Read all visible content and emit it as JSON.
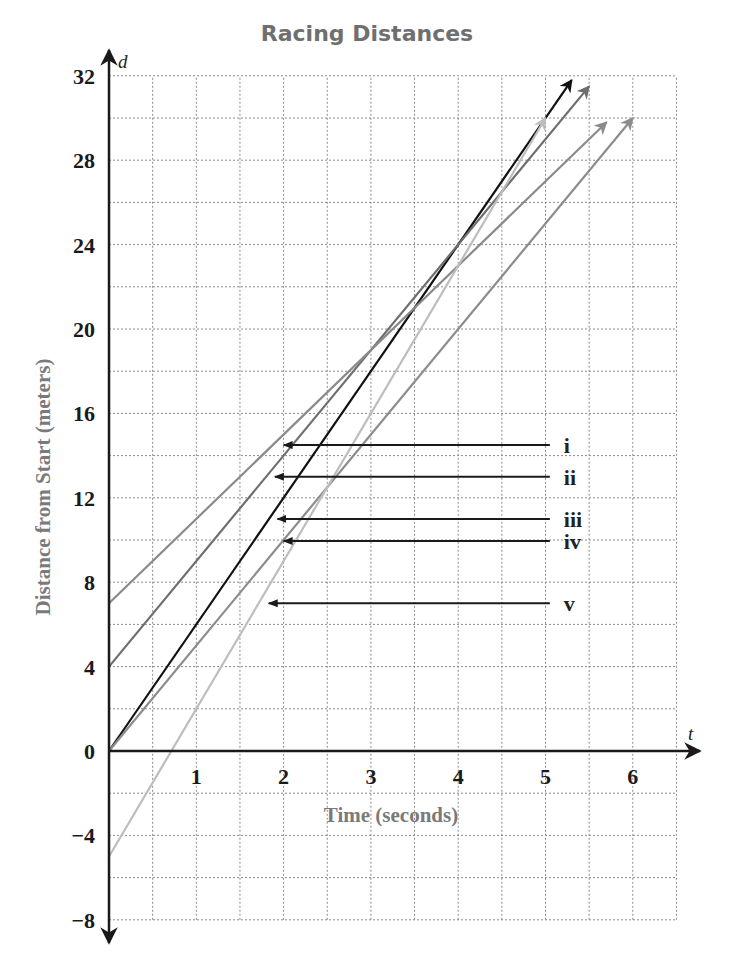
{
  "chart_data": {
    "type": "line",
    "title": "Racing Distances",
    "xlabel": "Time (seconds)",
    "ylabel": "Distance from Start (meters)",
    "x_var": "t",
    "y_var": "d",
    "xlim": [
      0,
      6.5
    ],
    "ylim": [
      -8,
      32
    ],
    "x_ticks": [
      1,
      2,
      3,
      4,
      5,
      6
    ],
    "y_ticks": [
      -8,
      -4,
      0,
      4,
      8,
      12,
      16,
      20,
      24,
      28,
      32
    ],
    "grid": {
      "on": true,
      "style": "dotted",
      "x_step": 0.5,
      "y_step": 2
    },
    "legend": "none (callout labels i–v)",
    "series": [
      {
        "name": "line-black",
        "intercept": 0,
        "slope": 6,
        "t_end": 5.3,
        "color": "#111111"
      },
      {
        "name": "line-gray-a",
        "intercept": 4,
        "slope": 5,
        "t_end": 5.5,
        "color": "#6e6e6e"
      },
      {
        "name": "line-gray-b",
        "intercept": 7,
        "slope": 4,
        "t_end": 5.7,
        "color": "#8a8a8a"
      },
      {
        "name": "line-gray-c",
        "intercept": 0,
        "slope": 5,
        "t_end": 6.0,
        "color": "#8c8c8c"
      },
      {
        "name": "line-light",
        "intercept": -5,
        "slope": 7,
        "t_end": 5.0,
        "color": "#bdbdbd"
      }
    ],
    "annotations": [
      {
        "label": "i",
        "d": 14.5,
        "t_tip": 2.0,
        "t_tail": 5.05
      },
      {
        "label": "ii",
        "d": 13.0,
        "t_tip": 1.9,
        "t_tail": 5.05
      },
      {
        "label": "iii",
        "d": 11.0,
        "t_tip": 1.93,
        "t_tail": 5.05
      },
      {
        "label": "iv",
        "d": 9.95,
        "t_tip": 2.0,
        "t_tail": 5.05
      },
      {
        "label": "v",
        "d": 7.0,
        "t_tip": 1.83,
        "t_tail": 5.05
      }
    ]
  }
}
